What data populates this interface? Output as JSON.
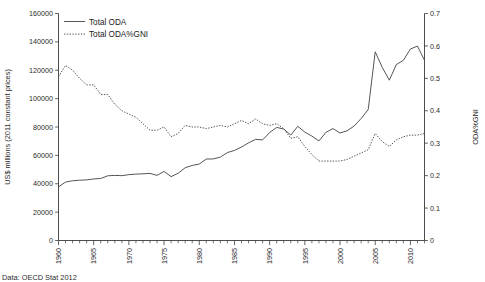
{
  "chart_data": {
    "type": "line",
    "title": "",
    "xlabel": "",
    "ylabel": "US$ millions (2011 constant prices)",
    "y2label": "ODA%GNI",
    "xlim": [
      1960,
      2012
    ],
    "ylim": [
      0,
      160000
    ],
    "y2lim": [
      0,
      0.7
    ],
    "grid": false,
    "legend_position": "top-left",
    "source_note": "Data: OECD Stat 2012",
    "x_tick_labels": [
      "1960",
      "1965",
      "1970",
      "1975",
      "1980",
      "1985",
      "1990",
      "1995",
      "2000",
      "2005",
      "2010"
    ],
    "x_tick_values": [
      1960,
      1965,
      1970,
      1975,
      1980,
      1985,
      1990,
      1995,
      2000,
      2005,
      2010
    ],
    "y_tick_labels": [
      "0",
      "20000",
      "40000",
      "60000",
      "80000",
      "100000",
      "120000",
      "140000",
      "160000"
    ],
    "y_tick_values": [
      0,
      20000,
      40000,
      60000,
      80000,
      100000,
      120000,
      140000,
      160000
    ],
    "y2_tick_labels": [
      "0",
      "0.1",
      "0.2",
      "0.3",
      "0.4",
      "0.5",
      "0.6",
      "0.7"
    ],
    "y2_tick_values": [
      0,
      0.1,
      0.2,
      0.3,
      0.4,
      0.5,
      0.6,
      0.7
    ],
    "x": [
      1960,
      1961,
      1962,
      1963,
      1964,
      1965,
      1966,
      1967,
      1968,
      1969,
      1970,
      1971,
      1972,
      1973,
      1974,
      1975,
      1976,
      1977,
      1978,
      1979,
      1980,
      1981,
      1982,
      1983,
      1984,
      1985,
      1986,
      1987,
      1988,
      1989,
      1990,
      1991,
      1992,
      1993,
      1994,
      1995,
      1996,
      1997,
      1998,
      1999,
      2000,
      2001,
      2002,
      2003,
      2004,
      2005,
      2006,
      2007,
      2008,
      2009,
      2010,
      2011,
      2012
    ],
    "series": [
      {
        "name": "Total ODA",
        "axis": "left",
        "style": "solid",
        "units": "US$ millions (2011 constant prices)",
        "values": [
          37800,
          41200,
          42100,
          42500,
          42700,
          43400,
          43700,
          45600,
          45900,
          45700,
          46400,
          46800,
          47000,
          47300,
          45900,
          48700,
          45000,
          47400,
          51300,
          52900,
          53900,
          57400,
          57500,
          58800,
          62000,
          63500,
          65900,
          68800,
          71300,
          70900,
          76100,
          79700,
          78600,
          74300,
          80500,
          76400,
          73600,
          70200,
          76200,
          78900,
          75800,
          77300,
          80700,
          86000,
          92300,
          133000,
          122000,
          113000,
          124000,
          127000,
          135000,
          137000,
          127000
        ]
      },
      {
        "name": "Total ODA%GNI",
        "axis": "right",
        "style": "dotted",
        "units": "ratio",
        "values": [
          0.505,
          0.54,
          0.525,
          0.5,
          0.48,
          0.48,
          0.45,
          0.45,
          0.42,
          0.4,
          0.39,
          0.38,
          0.36,
          0.34,
          0.34,
          0.35,
          0.32,
          0.33,
          0.355,
          0.35,
          0.35,
          0.345,
          0.35,
          0.355,
          0.35,
          0.36,
          0.37,
          0.36,
          0.375,
          0.36,
          0.355,
          0.36,
          0.345,
          0.315,
          0.32,
          0.29,
          0.265,
          0.245,
          0.245,
          0.245,
          0.245,
          0.25,
          0.26,
          0.27,
          0.28,
          0.33,
          0.305,
          0.29,
          0.31,
          0.32,
          0.325,
          0.325,
          0.33
        ]
      }
    ],
    "legend": [
      {
        "label": "Total ODA",
        "style": "solid"
      },
      {
        "label": "Total ODA%GNI",
        "style": "dotted"
      }
    ]
  }
}
